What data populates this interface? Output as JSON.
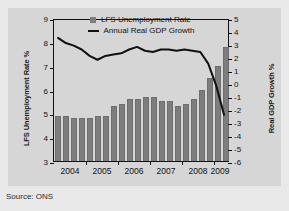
{
  "figure": {
    "clipped_caption": "",
    "source_note": "Source: ONS",
    "background_color": "#d6d6d6",
    "bar_color": "#7d7d7d",
    "line_color": "#111111"
  },
  "legend": {
    "position": "top-center",
    "entries": [
      {
        "label": "LFS Unemployment Rate",
        "marker": "square-swatch-icon",
        "color": "#7d7d7d"
      },
      {
        "label": "Annual Real GDP Growth",
        "marker": "line-swatch-icon",
        "color": "#111111"
      }
    ]
  },
  "chart_data": {
    "type": "bar",
    "title": "",
    "subtitle": "",
    "xlabel": "",
    "ylabel": "LFS Unemployment Rate %",
    "y2label": "Real GDP Growth %",
    "ylim": [
      3,
      9
    ],
    "y2lim": [
      -6,
      5
    ],
    "yticks": [
      3,
      4,
      5,
      6,
      7,
      8,
      9
    ],
    "yticklabels": [
      "3",
      "4",
      "5",
      "6",
      "7",
      "8",
      "9"
    ],
    "y2ticks": [
      -6,
      -5,
      -4,
      -3,
      -2,
      -1,
      0,
      1,
      2,
      3,
      4,
      5
    ],
    "y2ticklabels": [
      "-6",
      "-5",
      "-4",
      "-3",
      "-2",
      "-1",
      "0",
      "1",
      "2",
      "3",
      "4",
      "5"
    ],
    "grid": false,
    "xticks": [
      2004,
      2005,
      2006,
      2007,
      2008,
      2009
    ],
    "xticklabels": [
      "2004",
      "2005",
      "2006",
      "2007",
      "2008",
      "2009"
    ],
    "categories": [
      "2004 Q1",
      "2004 Q2",
      "2004 Q3",
      "2004 Q4",
      "2005 Q1",
      "2005 Q2",
      "2005 Q3",
      "2005 Q4",
      "2006 Q1",
      "2006 Q2",
      "2006 Q3",
      "2006 Q4",
      "2007 Q1",
      "2007 Q2",
      "2007 Q3",
      "2007 Q4",
      "2008 Q1",
      "2008 Q2",
      "2008 Q3",
      "2008 Q4",
      "2009 Q1",
      "2009 Q2"
    ],
    "series": [
      {
        "name": "LFS Unemployment Rate",
        "type": "bar",
        "axis": "left",
        "unit": "%",
        "color": "#7d7d7d",
        "values": [
          4.9,
          4.9,
          4.8,
          4.8,
          4.8,
          4.9,
          4.9,
          5.3,
          5.4,
          5.6,
          5.6,
          5.7,
          5.7,
          5.5,
          5.5,
          5.3,
          5.4,
          5.6,
          6.0,
          6.5,
          7.0,
          7.8
        ]
      },
      {
        "name": "Annual Real GDP Growth",
        "type": "line",
        "axis": "right",
        "unit": "%",
        "color": "#111111",
        "values": [
          3.6,
          3.2,
          3.0,
          2.7,
          2.2,
          1.9,
          2.2,
          2.3,
          2.4,
          2.7,
          2.9,
          2.6,
          2.5,
          2.7,
          2.7,
          2.6,
          2.7,
          2.6,
          2.5,
          1.6,
          -0.1,
          -2.4
        ]
      }
    ],
    "annotations": []
  }
}
